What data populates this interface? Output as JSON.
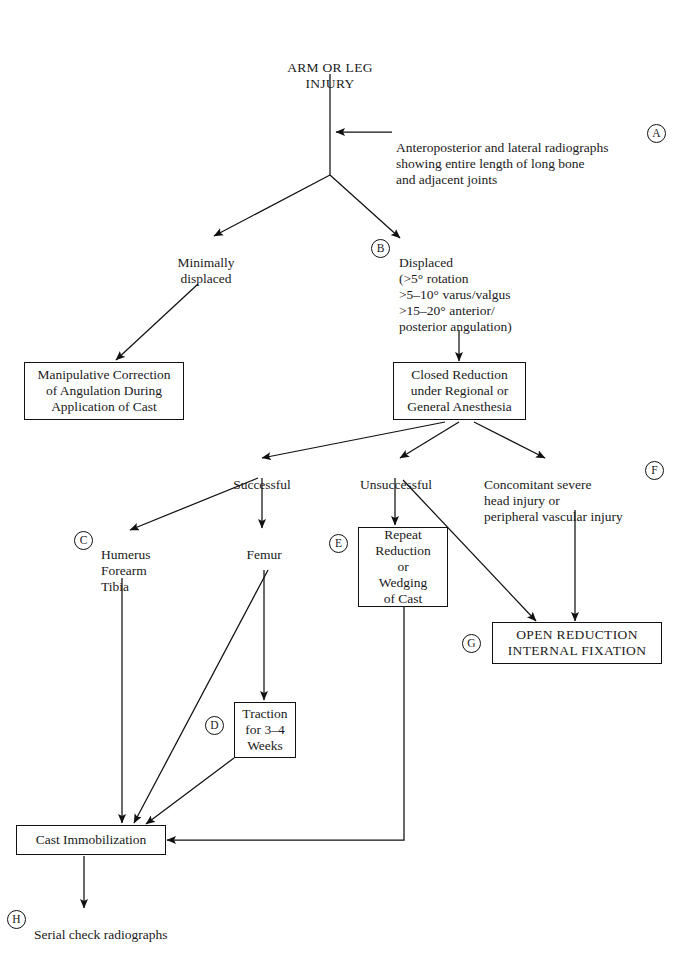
{
  "document": {
    "type": "clinical-algorithm-flowchart",
    "title": "ARM OR LEG\nINJURY",
    "background_color": "#ffffff",
    "line_color": "#111111",
    "text_color": "#1a1a1a"
  },
  "nodes": {
    "root": {
      "label": "ARM OR LEG\nINJURY"
    },
    "radiographs": {
      "ref": "A",
      "label": "Anteroposterior and lateral radiographs\nshowing entire length of long bone\nand adjacent joints"
    },
    "minimally_displaced": {
      "label": "Minimally\ndisplaced"
    },
    "displaced": {
      "ref": "B",
      "label": "Displaced\n(>5° rotation\n>5–10° varus/valgus\n>15–20° anterior/\nposterior angulation)"
    },
    "manipulative_correction": {
      "label": "Manipulative Correction\nof Angulation During\nApplication of Cast"
    },
    "closed_reduction": {
      "label": "Closed Reduction\nunder Regional or\nGeneral Anesthesia"
    },
    "successful": {
      "label": "Successful"
    },
    "unsuccessful": {
      "label": "Unsuccessful"
    },
    "concomitant": {
      "ref": "F",
      "label": "Concomitant severe\nhead injury or\nperipheral vascular injury"
    },
    "bone_group": {
      "ref": "C",
      "label": "Humerus\nForearm\nTibia"
    },
    "femur": {
      "label": "Femur"
    },
    "repeat_reduction": {
      "ref": "E",
      "label": "Repeat\nReduction\nor\nWedging\nof Cast"
    },
    "open_reduction": {
      "ref": "G",
      "label": "OPEN REDUCTION\nINTERNAL FIXATION"
    },
    "traction": {
      "ref": "D",
      "label": "Traction\nfor 3–4\nWeeks"
    },
    "cast_immobilization": {
      "label": "Cast Immobilization"
    },
    "serial_check": {
      "ref": "H",
      "label": "Serial check radiographs"
    }
  },
  "reference_letters": [
    "A",
    "B",
    "C",
    "D",
    "E",
    "F",
    "G",
    "H"
  ]
}
